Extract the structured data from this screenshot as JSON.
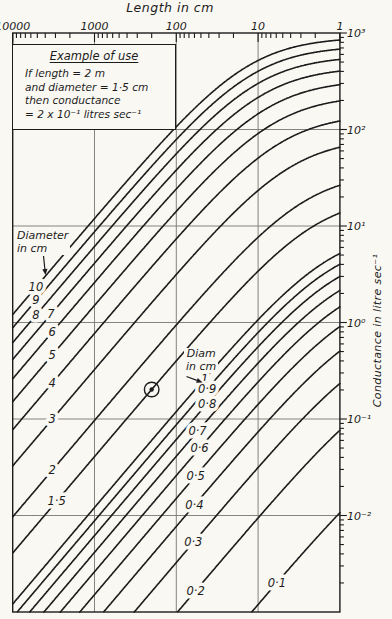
{
  "colors": {
    "ink": "#1c1c1c",
    "grid": "#787672",
    "paper": "#faf8f3"
  },
  "axis_titles": {
    "top": "Length in cm",
    "right": "Conductance in litre sec⁻¹"
  },
  "example_box": {
    "title": "Example of use",
    "lines": [
      "If length = 2 m",
      "and diameter = 1·5 cm",
      "then conductance",
      "= 2 x 10⁻¹ litres sec⁻¹"
    ]
  },
  "annotations": {
    "diameter_group": {
      "line1": "Diameter",
      "line2": "in cm"
    },
    "diam_group": {
      "line1": "Diam",
      "line2": "in cm"
    }
  },
  "chart_data": {
    "type": "line",
    "xlabel": "Length in cm",
    "ylabel": "Conductance in litre sec⁻¹",
    "x_axis": {
      "scale": "log-reversed",
      "range": [
        10000,
        1
      ],
      "tick_values": [
        10000,
        1000,
        100,
        10,
        1
      ],
      "tick_labels": [
        "10000",
        "1000",
        "100",
        "10",
        "1"
      ],
      "minor_ticks": "2-9 per decade, log spaced"
    },
    "y_axis": {
      "scale": "log",
      "range": [
        1000,
        0.001
      ],
      "tick_values": [
        1000,
        100,
        10,
        1,
        0.1,
        0.01
      ],
      "tick_labels": [
        "10³",
        "10²",
        "10¹",
        "10⁰",
        "10⁻¹",
        "10⁻²"
      ],
      "minor_ticks": "2-9 per decade, log spaced"
    },
    "grid": {
      "vertical_at": [
        1000,
        100,
        10
      ],
      "horizontal_at": [
        100,
        10,
        1,
        0.1,
        0.01
      ]
    },
    "model": {
      "description": "Each curve: conductance C(L) = 1 / ( L/(k_tube·D³) + 1/(k_aperture·D²) ), C in litre/sec, D and L in cm",
      "k_tube": 12.1,
      "k_aperture": 9.1
    },
    "series": [
      {
        "diameter": 10,
        "label": "10",
        "group": "Diameter in cm",
        "label_at_length": 5200,
        "conductance_at_L1": 846
      },
      {
        "diameter": 9,
        "label": "9",
        "group": "Diameter in cm",
        "label_at_length": 5200,
        "conductance_at_L1": 681
      },
      {
        "diameter": 8,
        "label": "8",
        "group": "Diameter in cm",
        "label_at_length": 5200,
        "conductance_at_L1": 530
      },
      {
        "diameter": 7,
        "label": "7",
        "group": "Diameter in cm",
        "label_at_length": 3400,
        "conductance_at_L1": 398
      },
      {
        "diameter": 6,
        "label": "6",
        "group": "Diameter in cm",
        "label_at_length": 3300,
        "conductance_at_L1": 287
      },
      {
        "diameter": 5,
        "label": "5",
        "group": "Diameter in cm",
        "label_at_length": 3300,
        "conductance_at_L1": 194
      },
      {
        "diameter": 4,
        "label": "4",
        "group": "Diameter in cm",
        "label_at_length": 3300,
        "conductance_at_L1": 121
      },
      {
        "diameter": 3,
        "label": "3",
        "group": "Diameter in cm",
        "label_at_length": 3300,
        "conductance_at_L1": 66
      },
      {
        "diameter": 2,
        "label": "2",
        "group": "Diameter in cm",
        "label_at_length": 3300,
        "conductance_at_L1": 28
      },
      {
        "diameter": 1.5,
        "label": "1·5",
        "group": "Diameter in cm",
        "label_at_length": 2900,
        "conductance_at_L1": 16
      },
      {
        "diameter": 1,
        "label": "1",
        "group": "Diam in cm",
        "label_at_length": 45,
        "conductance_at_L1": 5.2
      },
      {
        "diameter": 0.9,
        "label": "0·9",
        "group": "Diam in cm",
        "label_at_length": 42,
        "conductance_at_L1": 4
      },
      {
        "diameter": 0.8,
        "label": "0·8",
        "group": "Diam in cm",
        "label_at_length": 42,
        "conductance_at_L1": 3
      },
      {
        "diameter": 0.7,
        "label": "0·7",
        "group": "Diam in cm",
        "label_at_length": 55,
        "conductance_at_L1": 2.2
      },
      {
        "diameter": 0.6,
        "label": "0·6",
        "group": "Diam in cm",
        "label_at_length": 52,
        "conductance_at_L1": 1.5
      },
      {
        "diameter": 0.5,
        "label": "0·5",
        "group": "Diam in cm",
        "label_at_length": 58,
        "conductance_at_L1": 1.0
      },
      {
        "diameter": 0.4,
        "label": "0·4",
        "group": "Diam in cm",
        "label_at_length": 60,
        "conductance_at_L1": 0.6
      },
      {
        "diameter": 0.3,
        "label": "0·3",
        "group": "Diam in cm",
        "label_at_length": 62,
        "conductance_at_L1": 0.31
      },
      {
        "diameter": 0.2,
        "label": "0·2",
        "group": "Diam in cm",
        "label_at_length": 58,
        "conductance_at_L1": 0.13
      },
      {
        "diameter": 0.1,
        "label": "0·1",
        "group": "Diam in cm",
        "label_at_length": 5.9,
        "conductance_at_L1": 0.011
      }
    ],
    "example_point": {
      "length_cm": 200,
      "diameter_cm": 1.5,
      "conductance": 0.2,
      "marker": "circled-dot"
    },
    "legend_position": "labels on curves",
    "grid_on": true
  }
}
